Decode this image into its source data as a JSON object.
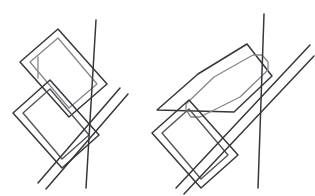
{
  "image": {
    "title": "Two abstract line-drawing figures",
    "description": "Black-and-white line drawing of two rotated geometric block figures composed of nested elongated rectangles, a rounded inner panel, long parallel diagonal rails and a near-vertical rod.",
    "background_color": "#ffffff",
    "stroke_color_dark": "#38383c",
    "stroke_color_mid": "#55555a",
    "stroke_color_light": "#86868c",
    "width": 315,
    "height": 196,
    "figure_count": 2
  },
  "figures": [
    {
      "id": "left-figure",
      "label": "Left figure",
      "parts": [
        {
          "id": "upper-bar-outer",
          "label": "Upper elongated bar outline"
        },
        {
          "id": "upper-bar-inner",
          "label": "Upper elongated bar inner outline"
        },
        {
          "id": "lower-bar-outer",
          "label": "Lower elongated bar outline"
        },
        {
          "id": "lower-bar-inner",
          "label": "Lower elongated bar inner outline"
        },
        {
          "id": "diagonal-rail-a",
          "label": "Long diagonal rail upper"
        },
        {
          "id": "diagonal-rail-b",
          "label": "Long diagonal rail lower"
        },
        {
          "id": "vertical-rod",
          "label": "Near-vertical rod"
        }
      ]
    },
    {
      "id": "right-figure",
      "label": "Right figure",
      "parts": [
        {
          "id": "upper-bar-outer",
          "label": "Upper elongated bar outline"
        },
        {
          "id": "rounded-panel",
          "label": "Rounded octagonal inner panel"
        },
        {
          "id": "lower-bar-outer",
          "label": "Lower elongated bar outline"
        },
        {
          "id": "lower-bar-inner",
          "label": "Lower elongated bar inner outline"
        },
        {
          "id": "diagonal-rail-a",
          "label": "Long diagonal rail upper"
        },
        {
          "id": "diagonal-rail-b",
          "label": "Long diagonal rail lower"
        },
        {
          "id": "vertical-rod",
          "label": "Near-vertical rod"
        }
      ]
    }
  ],
  "geometry": {
    "left": {
      "upper_bar_outer": "M 20,62 L 58,29 L 107,84 L 69,117 Z",
      "upper_bar_inner": "M 30,62 L 58,38 L 97,84 L 69,108 Z",
      "upper_bar_notch": "M 38,57 L 38,78",
      "lower_bar_outer": "M 13,113 L 50,80 L 99,135 L 62,168 Z",
      "lower_bar_inner": "M 23,113 L 50,89 L 89,135 L 62,159 Z",
      "diagonal_rail_a": "M 38,183 L 120,88",
      "diagonal_rail_b": "M 46,189 L 128,94",
      "vertical_rod": "M 96,20 L 86,188"
    },
    "right": {
      "upper_bar_outer": "M 157,110 L 198,74 L 247,44 L 272,76 L 234,112 Z",
      "rounded_panel": "M 186,110 L 186,104 L 214,77 L 253,55 L 262,55 L 268,62 L 268,70 L 240,97 L 200,117 L 191,117 Z",
      "lower_bar_outer": "M 152,133 L 189,100 L 238,155 L 201,188 Z",
      "lower_bar_inner": "M 162,133 L 189,109 L 228,155 L 201,179 Z",
      "diagonal_rail_a": "M 176,188 L 310,45",
      "diagonal_rail_b": "M 184,194 L 314,56",
      "vertical_rod": "M 264,14 L 258,188"
    }
  }
}
